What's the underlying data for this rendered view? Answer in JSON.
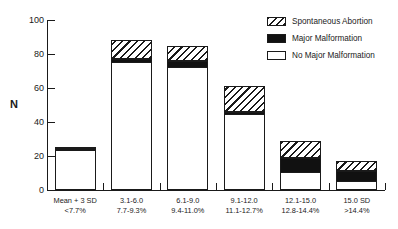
{
  "chart_data": {
    "type": "bar",
    "title": "",
    "xlabel": "",
    "ylabel": "N",
    "ylim": [
      0,
      100
    ],
    "yticks": [
      0,
      20,
      40,
      60,
      80,
      100
    ],
    "grid": false,
    "stacked": true,
    "legend_position": "top-right",
    "categories": [
      "Mean + 3 SD\n<7.7%",
      "3.1-6.0\n7.7-9.3%",
      "6.1-9.0\n9.4-11.0%",
      "9.1-12.0\n11.1-12.7%",
      "12.1-15.0\n12.8-14.4%",
      "15.0 SD\n>14.4%"
    ],
    "category_labels": [
      {
        "line1": "Mean + 3 SD",
        "line2": "<7.7%"
      },
      {
        "line1": "3.1-6.0",
        "line2": "7.7-9.3%"
      },
      {
        "line1": "6.1-9.0",
        "line2": "9.4-11.0%"
      },
      {
        "line1": "9.1-12.0",
        "line2": "11.1-12.7%"
      },
      {
        "line1": "12.1-15.0",
        "line2": "12.8-14.4%"
      },
      {
        "line1": "15.0 SD",
        "line2": ">14.4%"
      }
    ],
    "series": [
      {
        "name": "No Major Malformation",
        "fill": "white",
        "values": [
          23,
          75,
          72,
          44,
          10,
          5
        ]
      },
      {
        "name": "Major Malformation",
        "fill": "black",
        "values": [
          0.5,
          2,
          4,
          2,
          9,
          6
        ]
      },
      {
        "name": "Spontaneous Abortion",
        "fill": "hatched",
        "values": [
          1,
          11,
          9,
          15,
          10,
          6
        ]
      }
    ],
    "totals": [
      24,
      88,
      85,
      61,
      29,
      17
    ]
  },
  "legend": {
    "items": [
      {
        "label": "Spontaneous Abortion",
        "fill": "hatched"
      },
      {
        "label": "Major Malformation",
        "fill": "black"
      },
      {
        "label": "No Major Malformation",
        "fill": "white"
      }
    ]
  },
  "colors": {
    "axis": "#1a1a1a",
    "bar_outline": "#1a1a1a",
    "black_fill": "#111111",
    "white_fill": "#ffffff",
    "background": "#ffffff"
  }
}
